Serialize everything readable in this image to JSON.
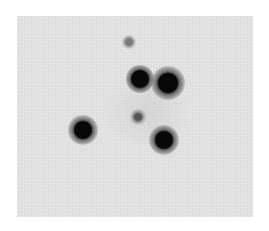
{
  "image": {
    "kind": "grayscale astronomical image",
    "background_color": "#e6e6e6",
    "frame": {
      "x": 17,
      "y": 16,
      "width": 236,
      "height": 201
    },
    "sources": [
      {
        "id": "faint-top",
        "x": 129,
        "y": 42,
        "core_radius": 3,
        "halo_radius": 7,
        "intensity": 0.55
      },
      {
        "id": "bright-a",
        "x": 140,
        "y": 79,
        "core_radius": 7,
        "halo_radius": 14,
        "intensity": 1.0
      },
      {
        "id": "bright-b",
        "x": 168,
        "y": 83,
        "core_radius": 8,
        "halo_radius": 17,
        "intensity": 1.0
      },
      {
        "id": "bright-c",
        "x": 83,
        "y": 130,
        "core_radius": 7,
        "halo_radius": 15,
        "intensity": 1.0
      },
      {
        "id": "faint-center",
        "x": 138,
        "y": 117,
        "core_radius": 3,
        "halo_radius": 8,
        "intensity": 0.75
      },
      {
        "id": "bright-d",
        "x": 164,
        "y": 140,
        "core_radius": 7,
        "halo_radius": 15,
        "intensity": 1.0
      }
    ]
  }
}
